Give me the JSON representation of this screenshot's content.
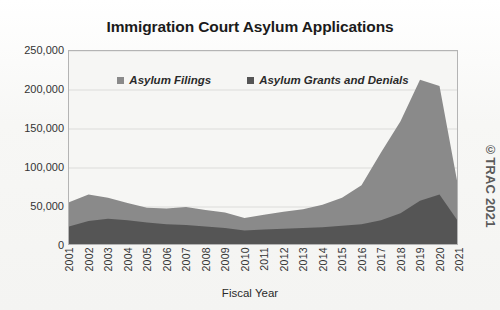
{
  "chart_data": {
    "type": "area",
    "title": "Immigration Court Asylum Applications",
    "xlabel": "Fiscal Year",
    "ylabel": "",
    "grid": true,
    "stacked": false,
    "legend_position": "top-center",
    "x": [
      "2001",
      "2002",
      "2003",
      "2004",
      "2005",
      "2006",
      "2007",
      "2008",
      "2009",
      "2010",
      "2011",
      "2012",
      "2013",
      "2014",
      "2015",
      "2016",
      "2017",
      "2018",
      "2019",
      "2020",
      "2021"
    ],
    "xlim": [
      "2001",
      "2021"
    ],
    "ylim": [
      0,
      250000
    ],
    "yticks": [
      0,
      50000,
      100000,
      150000,
      200000,
      250000
    ],
    "ytick_labels": [
      "0",
      "50,000",
      "100,000",
      "150,000",
      "200,000",
      "250,000"
    ],
    "series": [
      {
        "name": "Asylum Filings",
        "color": "#8a8a8a",
        "values": [
          56000,
          66000,
          62000,
          55000,
          49000,
          48000,
          50000,
          46000,
          43000,
          36000,
          40000,
          44000,
          47000,
          53000,
          62000,
          78000,
          120000,
          160000,
          213000,
          205000,
          70000
        ]
      },
      {
        "name": "Asylum Grants and Denials",
        "color": "#555555",
        "values": [
          25000,
          32000,
          35000,
          33000,
          30000,
          28000,
          27000,
          25000,
          23000,
          20000,
          21000,
          22000,
          23000,
          24000,
          26000,
          28000,
          33000,
          42000,
          58000,
          66000,
          30000
        ]
      }
    ],
    "legend": [
      {
        "label": "Asylum Filings",
        "color": "#8a8a8a"
      },
      {
        "label": "Asylum Grants and Denials",
        "color": "#555555"
      }
    ],
    "annotations": [
      {
        "name": "copyright-watermark",
        "text": "©TRAC 2021"
      }
    ]
  },
  "watermark": {
    "text": "©TRAC 2021"
  }
}
